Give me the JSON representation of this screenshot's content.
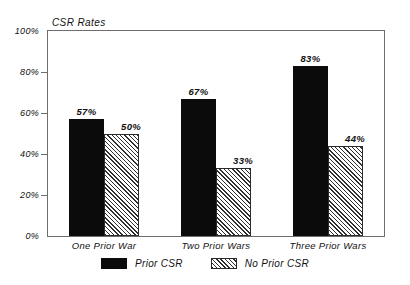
{
  "chart_data": {
    "type": "bar",
    "title": "CSR Rates",
    "xlabel": "",
    "ylabel": "",
    "ylim": [
      0,
      100
    ],
    "grid": false,
    "legend_position": "bottom-center",
    "categories": [
      "One Prior War",
      "Two Prior Wars",
      "Three Prior Wars"
    ],
    "ytick_labels": [
      "0%",
      "20%",
      "40%",
      "60%",
      "80%",
      "100%"
    ],
    "ytick_values": [
      0,
      20,
      40,
      60,
      80,
      100
    ],
    "series": [
      {
        "name": "Prior CSR",
        "fill": "solid-black",
        "color": "#0b0b0b",
        "values": [
          57,
          67,
          83
        ],
        "value_labels": [
          "57%",
          "67%",
          "83%"
        ]
      },
      {
        "name": "No Prior CSR",
        "fill": "diagonal-hatch",
        "color": "#2f2f2f",
        "values": [
          50,
          33,
          44
        ],
        "value_labels": [
          "50%",
          "33%",
          "44%"
        ]
      }
    ]
  },
  "legend": {
    "entries": [
      {
        "label": "Prior CSR",
        "swatch": "solid-black-swatch"
      },
      {
        "label": "No Prior CSR",
        "swatch": "hatched-swatch"
      }
    ]
  }
}
